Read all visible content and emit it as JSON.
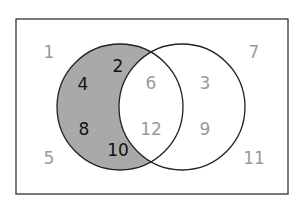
{
  "diagram": {
    "type": "venn",
    "universe": {
      "x": 16,
      "y": 19,
      "width": 272,
      "height": 175,
      "stroke": "#333333"
    },
    "sets": [
      {
        "name": "A",
        "cx": 120,
        "cy": 107,
        "r": 63,
        "fill_only_A": "#a9a9a9",
        "stroke": "#222222"
      },
      {
        "name": "B",
        "cx": 182,
        "cy": 107,
        "r": 63,
        "fill": "none",
        "stroke": "#222222"
      }
    ],
    "colors": {
      "shade": "#a9a9a9",
      "dark_text": "#111111",
      "light_text": "#9a9a9a"
    },
    "numbers": [
      {
        "label": "1",
        "x": 49,
        "y": 52,
        "region": "outside",
        "style": "light"
      },
      {
        "label": "2",
        "x": 118,
        "y": 66,
        "region": "A-only",
        "style": "dark"
      },
      {
        "label": "4",
        "x": 83,
        "y": 84,
        "region": "A-only",
        "style": "dark"
      },
      {
        "label": "6",
        "x": 151,
        "y": 83,
        "region": "A-and-B",
        "style": "light"
      },
      {
        "label": "3",
        "x": 205,
        "y": 83,
        "region": "B-only",
        "style": "light"
      },
      {
        "label": "7",
        "x": 254,
        "y": 52,
        "region": "outside",
        "style": "light"
      },
      {
        "label": "8",
        "x": 84,
        "y": 129,
        "region": "A-only",
        "style": "dark"
      },
      {
        "label": "12",
        "x": 151,
        "y": 129,
        "region": "A-and-B",
        "style": "light"
      },
      {
        "label": "9",
        "x": 205,
        "y": 129,
        "region": "B-only",
        "style": "light"
      },
      {
        "label": "10",
        "x": 118,
        "y": 150,
        "region": "A-only",
        "style": "dark"
      },
      {
        "label": "5",
        "x": 49,
        "y": 158,
        "region": "outside",
        "style": "light"
      },
      {
        "label": "11",
        "x": 254,
        "y": 158,
        "region": "outside",
        "style": "light"
      }
    ]
  }
}
